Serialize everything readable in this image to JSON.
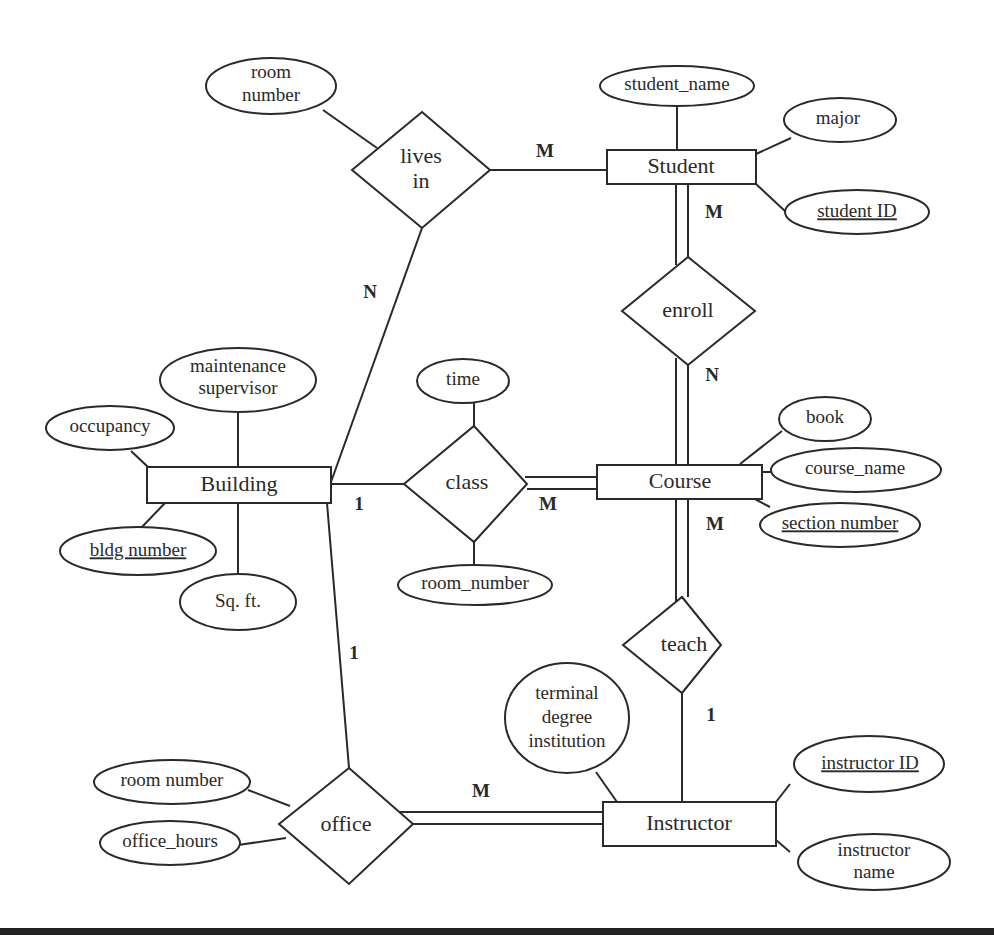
{
  "diagram": {
    "type": "entity-relationship",
    "entities": [
      {
        "id": "student",
        "label": "Student"
      },
      {
        "id": "course",
        "label": "Course"
      },
      {
        "id": "building",
        "label": "Building"
      },
      {
        "id": "instructor",
        "label": "Instructor"
      }
    ],
    "relationships": [
      {
        "id": "lives_in",
        "lines": [
          "lives",
          "in"
        ]
      },
      {
        "id": "enroll",
        "label": "enroll"
      },
      {
        "id": "class",
        "label": "class"
      },
      {
        "id": "teach",
        "label": "teach"
      },
      {
        "id": "office",
        "label": "office"
      }
    ],
    "attributes": {
      "lives_in_room_number": [
        "room",
        "number"
      ],
      "student_name": "student_name",
      "major": "major",
      "student_id": "student ID",
      "building_maintenance_supervisor": [
        "maintenance",
        "supervisor"
      ],
      "building_occupancy": "occupancy",
      "building_bldg_number": "bldg number",
      "building_sqft": "Sq. ft.",
      "class_time": "time",
      "class_room_number": "room_number",
      "course_book": "book",
      "course_name": "course_name",
      "course_section_number": "section number",
      "instructor_terminal_degree": [
        "terminal",
        "degree",
        "institution"
      ],
      "instructor_id": "instructor ID",
      "instructor_name": [
        "instructor",
        "name"
      ],
      "office_room_number": "room number",
      "office_hours": "office_hours"
    },
    "cardinalities": {
      "lives_in_student": "M",
      "lives_in_building": "N",
      "enroll_student": "M",
      "enroll_course": "N",
      "class_building": "1",
      "class_course": "M",
      "teach_course": "M",
      "teach_instructor": "1",
      "office_building": "1",
      "office_instructor": "M"
    }
  }
}
